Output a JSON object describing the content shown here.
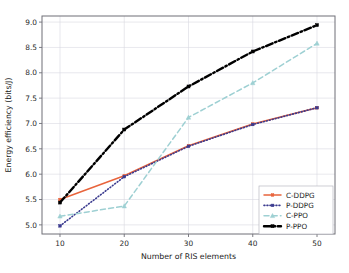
{
  "chart_data": {
    "type": "line",
    "title": "",
    "xlabel": "Number of RIS elements",
    "ylabel": "Energy efficiency (bits/J)",
    "x": [
      10,
      20,
      30,
      40,
      50
    ],
    "xticklabels": [
      "10",
      "20",
      "30",
      "40",
      "50"
    ],
    "yticklabels": [
      "5.0",
      "5.5",
      "6.0",
      "6.5",
      "7.0",
      "7.5",
      "8.0",
      "8.5",
      "9.0"
    ],
    "yticks": [
      5.0,
      5.5,
      6.0,
      6.5,
      7.0,
      7.5,
      8.0,
      8.5,
      9.0
    ],
    "xlim": [
      7.2,
      52.8
    ],
    "ylim": [
      4.82,
      9.12
    ],
    "grid": true,
    "legend_position": "lower right",
    "series": [
      {
        "name": "C-DDPG",
        "values": [
          5.5,
          5.97,
          6.56,
          6.99,
          7.31
        ],
        "color": "#e8643c",
        "style": "solid",
        "marker": "square"
      },
      {
        "name": "P-DDPG",
        "values": [
          4.98,
          5.95,
          6.55,
          6.98,
          7.31
        ],
        "color": "#3b3b8f",
        "style": "dotted",
        "marker": "square"
      },
      {
        "name": "C-PPO",
        "values": [
          5.17,
          5.37,
          7.12,
          7.8,
          8.58
        ],
        "color": "#9ed0d3",
        "style": "dashed",
        "marker": "triangle"
      },
      {
        "name": "P-PPO",
        "values": [
          5.44,
          6.88,
          7.73,
          8.42,
          8.94
        ],
        "color": "#000000",
        "style": "dashdot",
        "marker": "square"
      }
    ]
  },
  "legend": {
    "entries": [
      {
        "label": "C-DDPG"
      },
      {
        "label": "P-DDPG"
      },
      {
        "label": "C-PPO"
      },
      {
        "label": "P-PPO"
      }
    ]
  }
}
